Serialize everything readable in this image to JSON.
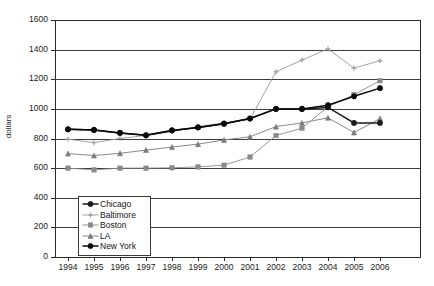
{
  "chart_data": {
    "type": "line",
    "title": "",
    "xlabel": "",
    "ylabel": "dollars",
    "categories": [
      "1994",
      "1995",
      "1996",
      "1997",
      "1998",
      "1999",
      "2000",
      "2001",
      "2002",
      "2003",
      "2004",
      "2005",
      "2006"
    ],
    "x": [
      1994,
      1995,
      1996,
      1997,
      1998,
      1999,
      2000,
      2001,
      2002,
      2003,
      2004,
      2005,
      2006
    ],
    "ylim": [
      0,
      1600
    ],
    "yticks": [
      0,
      200,
      400,
      600,
      800,
      1000,
      1200,
      1400,
      1600
    ],
    "grid": true,
    "legend_position": "inside-lower-left",
    "series": [
      {
        "name": "Chicago",
        "marker": "diamond",
        "color": "#1a1a1a",
        "values": [
          862,
          858,
          838,
          822,
          855,
          875,
          900,
          935,
          1000,
          1000,
          1010,
          905,
          905
        ]
      },
      {
        "name": "Baltimore",
        "marker": "plus",
        "color": "#9a9a9a",
        "values": [
          795,
          772,
          800,
          820,
          845,
          880,
          905,
          930,
          1250,
          1330,
          1405,
          1275,
          1325
        ]
      },
      {
        "name": "Boston",
        "marker": "dash",
        "color": "#8a8a8a",
        "values": [
          600,
          588,
          600,
          600,
          602,
          608,
          620,
          675,
          820,
          870,
          1015,
          1095,
          1190
        ]
      },
      {
        "name": "LA",
        "marker": "triangle",
        "color": "#7a7a7a",
        "values": [
          698,
          685,
          700,
          722,
          742,
          762,
          790,
          812,
          880,
          905,
          940,
          840,
          935
        ]
      },
      {
        "name": "New York",
        "marker": "filled-triangle",
        "color": "#0a0a0a",
        "values": [
          862,
          858,
          838,
          822,
          855,
          875,
          900,
          935,
          1000,
          1000,
          1025,
          1085,
          1140
        ]
      }
    ]
  },
  "axis": {
    "y_ticks": [
      "1600",
      "1400",
      "1200",
      "1000",
      "800",
      "600",
      "400",
      "200",
      "0"
    ],
    "y_axis_label": "dollars",
    "x_ticks": [
      "1994",
      "1995",
      "1996",
      "1997",
      "1998",
      "1999",
      "2000",
      "2001",
      "2002",
      "2003",
      "2004",
      "2005",
      "2006"
    ]
  },
  "legend": {
    "items": [
      {
        "label": "Chicago"
      },
      {
        "label": "Baltimore"
      },
      {
        "label": "Boston"
      },
      {
        "label": "LA"
      },
      {
        "label": "New York"
      }
    ]
  }
}
